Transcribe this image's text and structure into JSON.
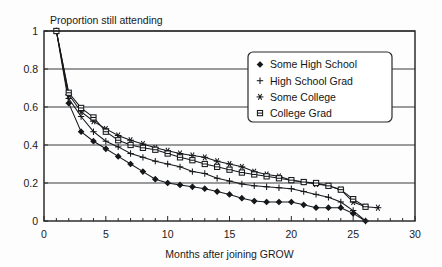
{
  "chart_data": {
    "type": "line",
    "title": "",
    "ylabel": "Proportion still attending",
    "xlabel": "Months after joining GROW",
    "xlim": [
      0,
      30
    ],
    "ylim": [
      0,
      1
    ],
    "xticks": [
      0,
      5,
      10,
      15,
      20,
      25,
      30
    ],
    "yticks": [
      0,
      0.2,
      0.4,
      0.6,
      0.8,
      1
    ],
    "xtick_labels": [
      "0",
      "5",
      "10",
      "15",
      "20",
      "25",
      "30"
    ],
    "ytick_labels": [
      "0",
      "0.2",
      "0.4",
      "0.6",
      "0.8",
      "1"
    ],
    "xtick_minor_step": 1,
    "grid": "horizontal",
    "legend_position": "upper-right-inside",
    "series": [
      {
        "name": "Some High School",
        "marker": "filled-diamond",
        "x": [
          1,
          2,
          3,
          4,
          5,
          6,
          7,
          8,
          9,
          10,
          11,
          12,
          13,
          14,
          15,
          16,
          17,
          18,
          19,
          20,
          21,
          22,
          23,
          24,
          25,
          26
        ],
        "y": [
          1.0,
          0.62,
          0.47,
          0.42,
          0.38,
          0.34,
          0.3,
          0.26,
          0.22,
          0.2,
          0.19,
          0.18,
          0.17,
          0.155,
          0.14,
          0.12,
          0.105,
          0.1,
          0.1,
          0.1,
          0.085,
          0.07,
          0.07,
          0.07,
          0.04,
          0.0
        ]
      },
      {
        "name": "High School Grad",
        "marker": "plus",
        "x": [
          1,
          2,
          3,
          4,
          5,
          6,
          7,
          8,
          9,
          10,
          11,
          12,
          13,
          14,
          15,
          16,
          17,
          18,
          19,
          20,
          21,
          22,
          23,
          24,
          25,
          26
        ],
        "y": [
          1.0,
          0.645,
          0.55,
          0.47,
          0.42,
          0.39,
          0.355,
          0.335,
          0.315,
          0.3,
          0.285,
          0.26,
          0.25,
          0.225,
          0.21,
          0.195,
          0.185,
          0.18,
          0.175,
          0.17,
          0.155,
          0.14,
          0.125,
          0.1,
          0.055,
          0.0
        ]
      },
      {
        "name": "Some College",
        "marker": "asterisk",
        "x": [
          1,
          2,
          3,
          4,
          5,
          6,
          7,
          8,
          9,
          10,
          11,
          12,
          13,
          14,
          15,
          16,
          17,
          18,
          19,
          20,
          21,
          22,
          23,
          24,
          25,
          26,
          27
        ],
        "y": [
          1.0,
          0.665,
          0.575,
          0.525,
          0.485,
          0.45,
          0.425,
          0.405,
          0.385,
          0.37,
          0.355,
          0.345,
          0.335,
          0.315,
          0.3,
          0.285,
          0.26,
          0.245,
          0.235,
          0.215,
          0.205,
          0.195,
          0.185,
          0.165,
          0.1,
          0.075,
          0.07
        ]
      },
      {
        "name": "College Grad",
        "marker": "circle-plus",
        "x": [
          1,
          2,
          3,
          4,
          5,
          6,
          7,
          8,
          9,
          10,
          11,
          12,
          13,
          14,
          15,
          16,
          17,
          18,
          19,
          20,
          21,
          22,
          23,
          24,
          25,
          26
        ],
        "y": [
          1.0,
          0.675,
          0.595,
          0.545,
          0.47,
          0.425,
          0.4,
          0.385,
          0.375,
          0.355,
          0.335,
          0.32,
          0.3,
          0.285,
          0.27,
          0.255,
          0.245,
          0.235,
          0.225,
          0.215,
          0.205,
          0.2,
          0.185,
          0.165,
          0.115,
          0.075
        ]
      }
    ]
  },
  "legend": {
    "items": [
      {
        "label": "Some High School"
      },
      {
        "label": "High School Grad"
      },
      {
        "label": "Some College"
      },
      {
        "label": "College Grad"
      }
    ]
  }
}
